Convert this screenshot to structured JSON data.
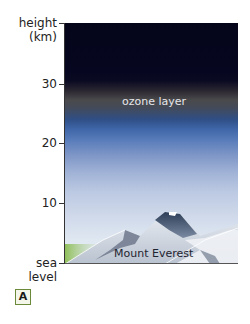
{
  "diagram": {
    "y_axis": {
      "title_line1": "height",
      "title_line2": "(km)",
      "ticks": [
        {
          "label": "30",
          "value": 30
        },
        {
          "label": "20",
          "value": 20
        },
        {
          "label": "10",
          "value": 10
        },
        {
          "label_line1": "sea",
          "label_line2": "level",
          "value": 0
        }
      ]
    },
    "labels": {
      "ozone": "ozone layer",
      "mountain": "Mount Everest"
    },
    "panel_letter": "A",
    "colors": {
      "space": "#05051a",
      "ozone_band": "#4a4a4c",
      "sky_blue": "#3f66a8",
      "low_sky": "#dfe7f1",
      "ground_green": "#8fbf5a",
      "letter_border": "#6a8a3a"
    }
  }
}
